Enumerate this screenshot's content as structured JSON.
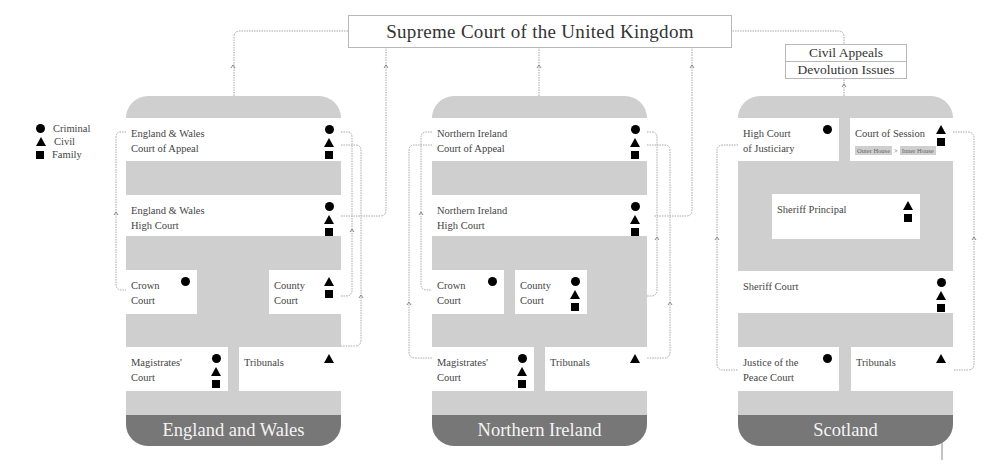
{
  "supreme_court": {
    "label": "Supreme Court of the United Kingdom"
  },
  "scotland_supreme_scope": {
    "items": [
      "Civil Appeals",
      "Devolution Issues"
    ]
  },
  "legend": {
    "items": [
      {
        "icon": "circle",
        "label": "Criminal"
      },
      {
        "icon": "triangle",
        "label": "Civil"
      },
      {
        "icon": "square",
        "label": "Family"
      }
    ]
  },
  "colors": {
    "panel": "#cfcfcf",
    "banner": "#777777",
    "box": "#ffffff",
    "line": "#9a9a9a"
  },
  "jurisdictions": {
    "england_wales": {
      "title": "England and Wales",
      "courts": {
        "court_of_appeal": {
          "label": "England & Wales\nCourt of Appeal",
          "line1": "England & Wales",
          "line2": "Court of Appeal",
          "types": [
            "criminal",
            "civil",
            "family"
          ]
        },
        "high_court": {
          "line1": "England & Wales",
          "line2": "High Court",
          "types": [
            "criminal",
            "civil",
            "family"
          ]
        },
        "crown_court": {
          "line1": "Crown",
          "line2": "Court",
          "types": [
            "criminal"
          ]
        },
        "county_court": {
          "line1": "County",
          "line2": "Court",
          "types": [
            "civil",
            "family"
          ]
        },
        "magistrates_court": {
          "line1": "Magistrates'",
          "line2": "Court",
          "types": [
            "criminal",
            "civil",
            "family"
          ]
        },
        "tribunals": {
          "line1": "Tribunals",
          "line2": "",
          "types": [
            "civil"
          ]
        }
      }
    },
    "northern_ireland": {
      "title": "Northern Ireland",
      "courts": {
        "court_of_appeal": {
          "line1": "Northern Ireland",
          "line2": "Court of Appeal",
          "types": [
            "criminal",
            "civil",
            "family"
          ]
        },
        "high_court": {
          "line1": "Northern Ireland",
          "line2": "High Court",
          "types": [
            "criminal",
            "civil",
            "family"
          ]
        },
        "crown_court": {
          "line1": "Crown",
          "line2": "Court",
          "types": [
            "criminal"
          ]
        },
        "county_court": {
          "line1": "County",
          "line2": "Court",
          "types": [
            "criminal",
            "civil",
            "family"
          ]
        },
        "magistrates_court": {
          "line1": "Magistrates'",
          "line2": "Court",
          "types": [
            "criminal",
            "civil",
            "family"
          ]
        },
        "tribunals": {
          "line1": "Tribunals",
          "line2": "",
          "types": [
            "civil"
          ]
        }
      }
    },
    "scotland": {
      "title": "Scotland",
      "courts": {
        "high_court_justiciary": {
          "line1": "High Court",
          "line2": "of Justiciary",
          "types": [
            "criminal"
          ]
        },
        "court_of_session": {
          "line1": "Court of Session",
          "line2": "",
          "types": [
            "civil",
            "family"
          ],
          "sub": {
            "outer": "Outer House",
            "sep": ">",
            "inner": "Inner House"
          }
        },
        "sheriff_principal": {
          "line1": "Sheriff Principal",
          "line2": "",
          "types": [
            "civil",
            "family"
          ]
        },
        "sheriff_court": {
          "line1": "Sheriff Court",
          "line2": "",
          "types": [
            "criminal",
            "civil",
            "family"
          ]
        },
        "justice_of_peace": {
          "line1": "Justice of the",
          "line2": "Peace Court",
          "types": [
            "criminal"
          ]
        },
        "tribunals": {
          "line1": "Tribunals",
          "line2": "",
          "types": [
            "civil"
          ]
        }
      }
    }
  }
}
